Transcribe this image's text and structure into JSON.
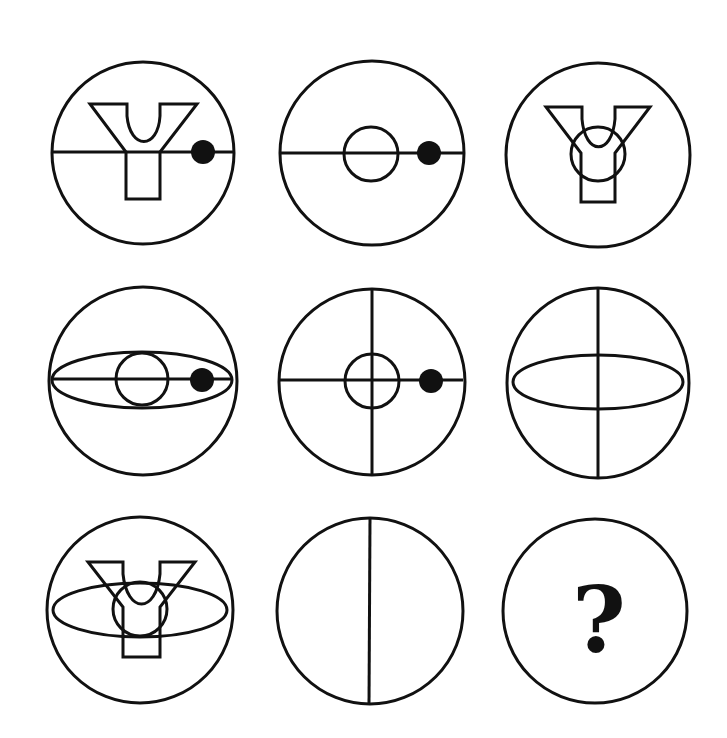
{
  "puzzle": {
    "type": "3x3 matrix reasoning",
    "stroke_color": "#111111",
    "fill_color": "#111111",
    "background": "#ffffff",
    "stroke_width": 3,
    "cells": [
      {
        "row": 1,
        "col": 1,
        "cx": 143,
        "cy": 153,
        "r": 91,
        "elements": [
          "horizontal-line",
          "y-shape",
          "filled-dot"
        ]
      },
      {
        "row": 1,
        "col": 2,
        "cx": 372,
        "cy": 153,
        "r": 92,
        "elements": [
          "horizontal-line",
          "small-circle",
          "filled-dot"
        ]
      },
      {
        "row": 1,
        "col": 3,
        "cx": 598,
        "cy": 155,
        "r": 92,
        "elements": [
          "y-shape",
          "small-circle"
        ]
      },
      {
        "row": 2,
        "col": 1,
        "cx": 143,
        "cy": 381,
        "r": 94,
        "elements": [
          "ellipse",
          "horizontal-line",
          "small-circle",
          "filled-dot"
        ]
      },
      {
        "row": 2,
        "col": 2,
        "cx": 372,
        "cy": 382,
        "r": 93,
        "elements": [
          "horizontal-line",
          "vertical-line",
          "small-circle",
          "filled-dot"
        ]
      },
      {
        "row": 2,
        "col": 3,
        "cx": 598,
        "cy": 383,
        "r": 92,
        "elements": [
          "ellipse",
          "vertical-line"
        ]
      },
      {
        "row": 3,
        "col": 1,
        "cx": 140,
        "cy": 610,
        "r": 93,
        "elements": [
          "ellipse",
          "y-shape",
          "small-circle"
        ]
      },
      {
        "row": 3,
        "col": 2,
        "cx": 370,
        "cy": 611,
        "r": 93,
        "elements": [
          "vertical-line"
        ]
      },
      {
        "row": 3,
        "col": 3,
        "cx": 595,
        "cy": 611,
        "r": 92,
        "elements": [
          "question-mark"
        ]
      }
    ],
    "question_mark": "?"
  }
}
